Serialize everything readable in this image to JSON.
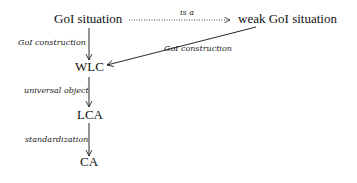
{
  "diagram": {
    "nodes": {
      "goi_situation": "GoI situation",
      "weak_goi_situation": "weak GoI situation",
      "wlc": "WLC",
      "lca": "LCA",
      "ca": "CA"
    },
    "edges": {
      "is_a": "is a",
      "goi_construction_left": "GoI construction",
      "goi_construction_right": "GoI construction",
      "universal_object": "universal object",
      "standardization": "standardization"
    },
    "colors": {
      "ink": "#111111",
      "background": "#ffffff"
    }
  }
}
